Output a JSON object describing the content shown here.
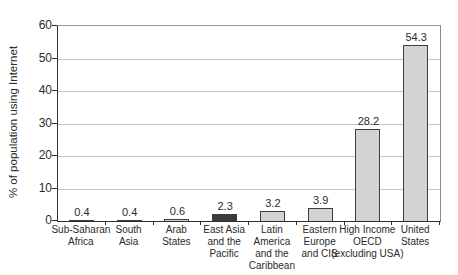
{
  "figure": {
    "background": "#ffffff"
  },
  "chart_data": {
    "type": "bar",
    "title": "",
    "xlabel": "",
    "ylabel": "% of population using Internet",
    "ylim": [
      0,
      60
    ],
    "yticks": [
      0,
      10,
      20,
      30,
      40,
      50,
      60
    ],
    "grid": "horizontal",
    "legend": "none",
    "categories": [
      "Sub-Saharan Africa",
      "South Asia",
      "Arab States",
      "East Asia and the Pacific",
      "Latin America and the Caribbean",
      "Eastern Europe and CIS",
      "High Income OECD (excluding USA)",
      "United States"
    ],
    "category_lines": [
      [
        "Sub-Saharan",
        "Africa"
      ],
      [
        "South",
        "Asia"
      ],
      [
        "Arab",
        "States"
      ],
      [
        "East Asia",
        "and the",
        "Pacific"
      ],
      [
        "Latin",
        "America",
        "and the",
        "Caribbean"
      ],
      [
        "Eastern",
        "Europe",
        "and CIS"
      ],
      [
        "High Income",
        "OECD",
        "(excluding USA)"
      ],
      [
        "United",
        "States"
      ]
    ],
    "values": [
      0.4,
      0.4,
      0.6,
      2.3,
      3.2,
      3.9,
      28.2,
      54.3
    ],
    "value_labels": [
      "0.4",
      "0.4",
      "0.6",
      "2.3",
      "3.2",
      "3.9",
      "28.2",
      "54.3"
    ],
    "highlight_index": 3,
    "colors": {
      "bar_fill": "#d3d3d3",
      "bar_border": "#3d3d3d",
      "highlight_fill": "#3a3a3a",
      "gridline": "#c6c6c6",
      "axis": "#2e2e2e",
      "text": "#2b2b2b",
      "background": "#ffffff"
    }
  }
}
